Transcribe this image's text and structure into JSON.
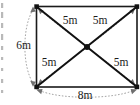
{
  "diagram": {
    "type": "geometry-rectangle-with-diagonals",
    "shape": "rectangle",
    "units": "m",
    "labels": {
      "diagonal_half_top_left": "5m",
      "diagonal_half_top_right": "5m",
      "diagonal_half_bottom_left": "5m",
      "diagonal_half_bottom_right": "5m",
      "height_left": "6m",
      "width_bottom": "8m"
    },
    "measurements": [
      {
        "name": "center-to-top-left",
        "value": "5m",
        "number": 5
      },
      {
        "name": "center-to-top-right",
        "value": "5m",
        "number": 5
      },
      {
        "name": "center-to-bottom-left",
        "value": "5m",
        "number": 5
      },
      {
        "name": "center-to-bottom-right",
        "value": "5m",
        "number": 5
      },
      {
        "name": "left-side-height",
        "value": "6m",
        "number": 6
      },
      {
        "name": "bottom-side-width",
        "value": "8m",
        "number": 8
      }
    ],
    "colors": {
      "outline": "#1a1a1a",
      "diagonal": "#111111",
      "dimension": "#9a9a9a",
      "background": "#ffffff",
      "text": "#1a1a1a"
    },
    "vertices": {
      "top_left": "top-left-corner",
      "top_right": "top-right-corner",
      "bottom_left": "bottom-left-corner",
      "bottom_right": "bottom-right-corner",
      "center": "diagonal-intersection-point"
    }
  }
}
